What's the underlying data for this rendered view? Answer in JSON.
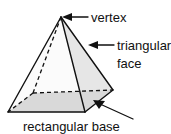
{
  "figure": {
    "shape_name": "rectangular pyramid",
    "colors": {
      "outline": "#111111",
      "left_face_fill": "#fbfbfb",
      "right_face_fill": "#e6e6e6",
      "base_fill": "#d9d9d9",
      "background": "#ffffff",
      "text": "#111111"
    }
  },
  "labels": {
    "vertex": "vertex",
    "triangular": "triangular",
    "face": "face",
    "rectangular_base": "rectangular base"
  },
  "geometry": {
    "apex": [
      61,
      17
    ],
    "base_left": [
      8,
      112
    ],
    "base_front": [
      85,
      112
    ],
    "base_right": [
      113,
      90
    ],
    "base_back": [
      33,
      93
    ]
  }
}
